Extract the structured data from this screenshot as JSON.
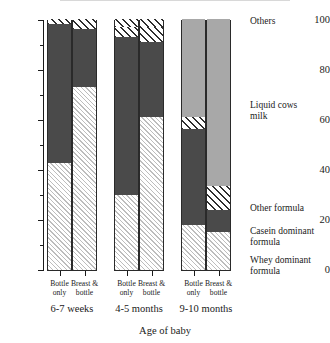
{
  "chart_data": {
    "type": "bar",
    "subtype": "stacked-bar-100",
    "title": "",
    "xlabel": "Age of baby",
    "ylabel": "% giving each type of milk",
    "ylim": [
      0,
      100
    ],
    "yticks": [
      0,
      20,
      40,
      60,
      80,
      100
    ],
    "ytick_labels": [
      "0",
      "20",
      "40",
      "60",
      "80",
      "100"
    ],
    "minor_ticks": [
      10,
      30,
      50,
      70,
      90
    ],
    "grid": false,
    "legend_position": "right",
    "groups": [
      {
        "label": "6-7 weeks",
        "bars": [
          {
            "label": "Bottle\nonly",
            "values": {
              "whey": 42.5,
              "casein": 55.5,
              "other": 0,
              "liquid": 0,
              "others": 2.0
            }
          },
          {
            "label": "Breast &\nbottle",
            "values": {
              "whey": 73.0,
              "casein": 23.0,
              "other": 0,
              "liquid": 0,
              "others": 4.0
            }
          }
        ]
      },
      {
        "label": "4-5 months",
        "bars": [
          {
            "label": "Bottle\nonly",
            "values": {
              "whey": 30.0,
              "casein": 62.8,
              "other": 4.0,
              "liquid": 0,
              "others": 3.2
            }
          },
          {
            "label": "Breast &\nbottle",
            "values": {
              "whey": 61.0,
              "casein": 30.0,
              "other": 5.8,
              "liquid": 0,
              "others": 3.2
            }
          }
        ]
      },
      {
        "label": "9-10 months",
        "bars": [
          {
            "label": "Bottle\nonly",
            "values": {
              "whey": 18.0,
              "casein": 38.0,
              "other": 5.0,
              "liquid": 39.0,
              "others": 0
            }
          },
          {
            "label": "Breast &\nbottle",
            "values": {
              "whey": 15.0,
              "casein": 9.0,
              "other": 9.5,
              "liquid": 66.5,
              "others": 0
            }
          }
        ]
      }
    ],
    "series": [
      {
        "key": "whey",
        "name": "Whey dominant\n formula",
        "pattern": "light-diagonal-hatch",
        "color": "#ffffff"
      },
      {
        "key": "casein",
        "name": "Casein dominant\n formula",
        "pattern": "solid-dark",
        "color": "#4a4a4a"
      },
      {
        "key": "other",
        "name": "Other formula",
        "pattern": "bold-diagonal-hatch",
        "color": "#ffffff"
      },
      {
        "key": "liquid",
        "name": "Liquid cows\nmilk",
        "pattern": "solid-light-gray",
        "color": "#a8a8a8"
      },
      {
        "key": "others",
        "name": "Others",
        "pattern": "bold-diagonal-hatch",
        "color": "#ffffff"
      }
    ]
  },
  "legend": {
    "others": "Others",
    "liquid": "Liquid cows\nmilk",
    "other_formula": "Other formula",
    "casein": "Casein dominant\nformula",
    "whey": "Whey dominant\n formula"
  },
  "axis": {
    "y_title": "% giving each type of milk",
    "x_title": "Age of baby",
    "ytick_100": "100",
    "ytick_80": "80",
    "ytick_60": "60",
    "ytick_40": "40",
    "ytick_20": "20",
    "ytick_0": "0"
  },
  "xaxis": {
    "bar_labels": [
      "Bottle\nonly",
      "Breast &\nbottle",
      "Bottle\nonly",
      "Breast &\nbottle",
      "Bottle\nonly",
      "Breast &\nbottle"
    ],
    "group_labels": [
      "6-7 weeks",
      "4-5 months",
      "9-10 months"
    ]
  }
}
